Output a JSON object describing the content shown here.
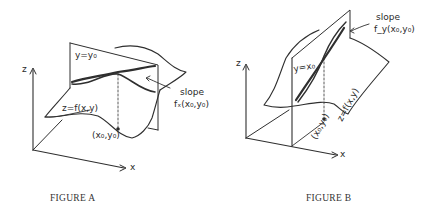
{
  "figures": [
    {
      "id": "A",
      "caption": "FIGURE A",
      "labels": {
        "plane": "y=y₀",
        "surface": "z=f(x,y)",
        "point": "(x₀,y₀)",
        "slope_word": "slope",
        "slope_expr": "fₓ(x₀,y₀)",
        "axis_z": "z",
        "axis_x": "x"
      }
    },
    {
      "id": "B",
      "caption": "FIGURE B",
      "labels": {
        "plane": "y=x₀",
        "surface": "z=f(x,y)",
        "point": "(x₀,y₀)",
        "slope_word": "slope",
        "slope_expr": "f_y(x₀,y₀)",
        "axis_z": "z",
        "axis_x": "x"
      }
    }
  ],
  "colors": {
    "ink": "#2f2f2f",
    "background": "#ffffff"
  }
}
